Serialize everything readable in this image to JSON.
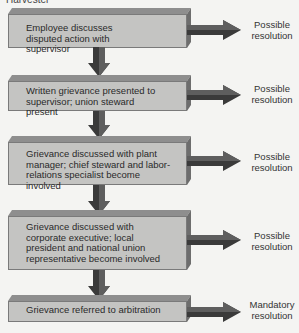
{
  "caption": "Harvester",
  "steps": [
    {
      "text": "Employee discusses disputed action with supervisor",
      "outcome": "Possible resolution"
    },
    {
      "text": "Written grievance presented to supervisor; union steward present",
      "outcome": "Possible resolution"
    },
    {
      "text": "Grievance discussed with plant manager; chief steward and labor-relations specialist become involved",
      "outcome": "Possible resolution"
    },
    {
      "text": "Grievance discussed with corporate executive; local president and national union representative become involved",
      "outcome": "Possible resolution"
    },
    {
      "text": "Grievance referred to arbitration",
      "outcome": "Mandatory resolution"
    }
  ],
  "colors": {
    "box_front": "#c4c4c2",
    "box_top": "#8e8e8e",
    "arrow": "#3a3a3a",
    "background": "#f4f4f2"
  }
}
